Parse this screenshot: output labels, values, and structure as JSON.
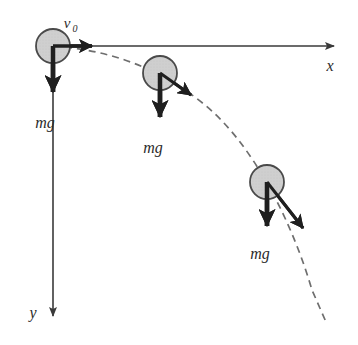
{
  "figure": {
    "background_color": "#ffffff",
    "width": 358,
    "height": 345
  },
  "colors": {
    "axis": "#3a3a3a",
    "ball_fill": "#cfcfcf",
    "ball_stroke": "#4a4a4a",
    "trajectory": "#6e6e6e",
    "vector": "#1f1f1f",
    "label": "#2b2b2b"
  },
  "axes": {
    "origin": {
      "x": 53,
      "y": 46
    },
    "x_axis": {
      "label": "x",
      "label_position": {
        "x": 330,
        "y": 67
      },
      "from": {
        "x": 53,
        "y": 46
      },
      "to": {
        "x": 340,
        "y": 46
      },
      "direction": "right"
    },
    "y_axis": {
      "label": "y",
      "label_position": {
        "x": 30,
        "y": 317
      },
      "from": {
        "x": 53,
        "y": 46
      },
      "to": {
        "x": 53,
        "y": 322
      },
      "direction": "down"
    }
  },
  "trajectory": {
    "style": "dashed",
    "description": "parabolic path of projectile",
    "points": [
      {
        "x": 53,
        "y": 46
      },
      {
        "x": 120,
        "y": 56
      },
      {
        "x": 170,
        "y": 77
      },
      {
        "x": 215,
        "y": 115
      },
      {
        "x": 255,
        "y": 165
      },
      {
        "x": 290,
        "y": 228
      },
      {
        "x": 318,
        "y": 300
      },
      {
        "x": 328,
        "y": 322
      }
    ]
  },
  "balls": [
    {
      "id": "ball-initial",
      "center": {
        "x": 53,
        "y": 46
      },
      "radius": 17,
      "weight_label": "mg",
      "weight_label_position": {
        "x": 30,
        "y": 127
      },
      "weight_arrow": {
        "from": {
          "x": 53,
          "y": 46
        },
        "to": {
          "x": 53,
          "y": 103
        }
      },
      "velocity_label": "v",
      "velocity_label_sub": "0",
      "velocity_label_position": {
        "x": 64,
        "y": 24
      },
      "velocity_arrow": {
        "from": {
          "x": 53,
          "y": 46
        },
        "to": {
          "x": 106,
          "y": 46
        }
      }
    },
    {
      "id": "ball-middle",
      "center": {
        "x": 160,
        "y": 73
      },
      "radius": 17,
      "weight_label": "mg",
      "weight_label_position": {
        "x": 137,
        "y": 152
      },
      "weight_arrow": {
        "from": {
          "x": 160,
          "y": 73
        },
        "to": {
          "x": 160,
          "y": 128
        }
      },
      "velocity_arrow": {
        "from": {
          "x": 160,
          "y": 73
        },
        "to": {
          "x": 206,
          "y": 106
        }
      }
    },
    {
      "id": "ball-final",
      "center": {
        "x": 267,
        "y": 182
      },
      "radius": 17,
      "weight_label": "mg",
      "weight_label_position": {
        "x": 244,
        "y": 258
      },
      "weight_arrow": {
        "from": {
          "x": 267,
          "y": 182
        },
        "to": {
          "x": 267,
          "y": 237
        }
      },
      "velocity_arrow": {
        "from": {
          "x": 267,
          "y": 182
        },
        "to": {
          "x": 320,
          "y": 243
        }
      }
    }
  ]
}
